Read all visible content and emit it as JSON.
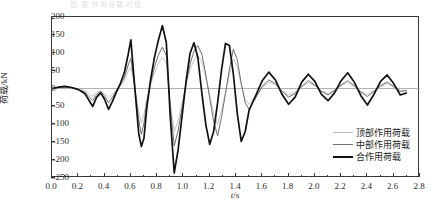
{
  "caption_fragment": "图 载 作用荷载 时程",
  "axes": {
    "ylabel": "荷载/kN",
    "xlabel_pre": "t",
    "xlabel_post": "/s",
    "yticks": [
      200,
      150,
      100,
      50,
      0,
      -50,
      -100,
      -150,
      -200,
      -250
    ],
    "xticks": [
      "0.0",
      "0.2",
      "0.4",
      "0.6",
      "0.8",
      "1.0",
      "1.2",
      "1.4",
      "1.6",
      "1.8",
      "2.0",
      "2.2",
      "2.4",
      "2.6",
      "2.8"
    ]
  },
  "legend": [
    {
      "label": "顶部作用荷载",
      "color": "#b9b9b9",
      "width": 1.0
    },
    {
      "label": "中部作用荷载",
      "color": "#6f6f6f",
      "width": 1.2
    },
    {
      "label": "合作用荷载",
      "color": "#111111",
      "width": 2.0
    }
  ],
  "chart_data": {
    "type": "line",
    "title": "",
    "xlabel": "t/s",
    "ylabel": "荷载/kN",
    "xlim": [
      0.0,
      2.8
    ],
    "ylim": [
      -250,
      200
    ],
    "grid": false,
    "legend_position": "inside-bottom-right",
    "zero_line": true,
    "series": [
      {
        "name": "顶部作用荷载",
        "color": "#b9b9b9",
        "x": [
          0.0,
          0.05,
          0.1,
          0.15,
          0.2,
          0.25,
          0.28,
          0.31,
          0.34,
          0.37,
          0.4,
          0.43,
          0.46,
          0.49,
          0.52,
          0.55,
          0.58,
          0.6,
          0.62,
          0.64,
          0.66,
          0.68,
          0.7,
          0.72,
          0.75,
          0.78,
          0.81,
          0.84,
          0.87,
          0.9,
          0.93,
          0.96,
          0.99,
          1.02,
          1.05,
          1.08,
          1.11,
          1.14,
          1.17,
          1.2,
          1.23,
          1.26,
          1.29,
          1.32,
          1.35,
          1.38,
          1.41,
          1.44,
          1.47,
          1.5,
          1.55,
          1.6,
          1.65,
          1.7,
          1.75,
          1.8,
          1.85,
          1.9,
          1.95,
          2.0,
          2.05,
          2.1,
          2.15,
          2.2,
          2.25,
          2.3,
          2.35,
          2.4,
          2.45,
          2.5,
          2.55,
          2.6,
          2.65,
          2.7
        ],
        "y": [
          0,
          2,
          3,
          2,
          0,
          -6,
          -14,
          -22,
          -10,
          -6,
          -14,
          -26,
          -16,
          -4,
          6,
          20,
          48,
          60,
          22,
          -20,
          -66,
          -96,
          -72,
          -30,
          10,
          44,
          70,
          88,
          70,
          -40,
          -120,
          -90,
          -40,
          10,
          52,
          80,
          92,
          74,
          30,
          -20,
          -70,
          -100,
          -60,
          -10,
          40,
          84,
          60,
          10,
          -30,
          -44,
          -20,
          4,
          18,
          10,
          -6,
          -18,
          -10,
          4,
          16,
          8,
          -6,
          -14,
          -4,
          8,
          16,
          6,
          -8,
          -16,
          -6,
          6,
          14,
          4,
          -6,
          -4
        ]
      },
      {
        "name": "中部作用荷载",
        "color": "#6f6f6f",
        "x": [
          0.0,
          0.05,
          0.1,
          0.15,
          0.2,
          0.25,
          0.28,
          0.31,
          0.34,
          0.37,
          0.4,
          0.43,
          0.46,
          0.49,
          0.52,
          0.55,
          0.58,
          0.6,
          0.62,
          0.64,
          0.66,
          0.68,
          0.7,
          0.72,
          0.75,
          0.78,
          0.81,
          0.84,
          0.87,
          0.9,
          0.93,
          0.96,
          0.99,
          1.02,
          1.05,
          1.08,
          1.11,
          1.14,
          1.17,
          1.2,
          1.23,
          1.26,
          1.29,
          1.32,
          1.35,
          1.38,
          1.41,
          1.44,
          1.47,
          1.5,
          1.55,
          1.6,
          1.65,
          1.7,
          1.75,
          1.8,
          1.85,
          1.9,
          1.95,
          2.0,
          2.05,
          2.1,
          2.15,
          2.2,
          2.25,
          2.3,
          2.35,
          2.4,
          2.45,
          2.5,
          2.55,
          2.6,
          2.65,
          2.7
        ],
        "y": [
          0,
          3,
          4,
          2,
          -2,
          -10,
          -22,
          -34,
          -16,
          -8,
          -20,
          -40,
          -24,
          -6,
          10,
          30,
          66,
          84,
          32,
          -28,
          -88,
          -128,
          -96,
          -40,
          16,
          60,
          94,
          116,
          92,
          -52,
          -160,
          -118,
          -52,
          14,
          68,
          104,
          120,
          96,
          40,
          -26,
          -92,
          -132,
          -80,
          -14,
          54,
          110,
          80,
          14,
          -40,
          -58,
          -26,
          6,
          24,
          14,
          -8,
          -24,
          -14,
          6,
          22,
          10,
          -8,
          -18,
          -6,
          10,
          22,
          8,
          -10,
          -22,
          -8,
          8,
          18,
          6,
          -8,
          -6
        ]
      },
      {
        "name": "合作用荷载",
        "color": "#111111",
        "x": [
          0.0,
          0.05,
          0.1,
          0.15,
          0.2,
          0.25,
          0.28,
          0.31,
          0.34,
          0.37,
          0.4,
          0.43,
          0.46,
          0.49,
          0.52,
          0.55,
          0.58,
          0.6,
          0.62,
          0.64,
          0.66,
          0.68,
          0.7,
          0.72,
          0.75,
          0.78,
          0.81,
          0.84,
          0.87,
          0.9,
          0.93,
          0.96,
          0.99,
          1.02,
          1.05,
          1.08,
          1.11,
          1.14,
          1.17,
          1.2,
          1.23,
          1.26,
          1.29,
          1.32,
          1.35,
          1.38,
          1.41,
          1.44,
          1.47,
          1.5,
          1.55,
          1.6,
          1.65,
          1.7,
          1.75,
          1.8,
          1.85,
          1.9,
          1.95,
          2.0,
          2.05,
          2.1,
          2.15,
          2.2,
          2.25,
          2.3,
          2.35,
          2.4,
          2.45,
          2.5,
          2.55,
          2.6,
          2.65,
          2.7
        ],
        "y": [
          0,
          4,
          6,
          3,
          -3,
          -14,
          -32,
          -50,
          -24,
          -12,
          -30,
          -58,
          -36,
          -10,
          14,
          44,
          96,
          136,
          46,
          -40,
          -126,
          -162,
          -138,
          -58,
          24,
          88,
          136,
          176,
          128,
          -80,
          -236,
          -170,
          -76,
          20,
          98,
          128,
          86,
          -12,
          -100,
          -156,
          -120,
          -40,
          52,
          126,
          120,
          40,
          -70,
          -148,
          -120,
          -60,
          -20,
          22,
          46,
          24,
          -16,
          -44,
          -24,
          18,
          40,
          20,
          -16,
          -34,
          -12,
          22,
          44,
          18,
          -20,
          -46,
          -16,
          20,
          38,
          14,
          -18,
          -12
        ]
      }
    ]
  }
}
